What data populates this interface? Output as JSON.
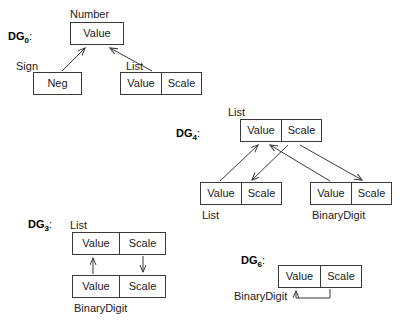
{
  "diagram": {
    "title_text": "",
    "stroke_color": "#3a3a3a",
    "text_color": "#1a1a1a",
    "background_color": "#ffffff",
    "cell_labels": {
      "value": "Value",
      "scale": "Scale",
      "neg": "Neg"
    },
    "type_labels": {
      "number": "Number",
      "sign": "Sign",
      "list": "List",
      "binary_digit": "BinaryDigit"
    },
    "graphs": [
      {
        "id": "dg0",
        "name": "DG",
        "subscript": "0",
        "colon": ":",
        "nodes": [
          {
            "id": "dg0-root",
            "type_label": "Number",
            "cells": [
              "Value"
            ]
          },
          {
            "id": "dg0-sign",
            "type_label": "Sign",
            "cells": [
              "Neg"
            ]
          },
          {
            "id": "dg0-list",
            "type_label": "List",
            "cells": [
              "Value",
              "Scale"
            ]
          }
        ],
        "edges": [
          {
            "from": "dg0-sign",
            "to": "dg0-root",
            "direction": "up"
          },
          {
            "from": "dg0-list",
            "to": "dg0-root",
            "direction": "up"
          }
        ]
      },
      {
        "id": "dg4",
        "name": "DG",
        "subscript": "4",
        "colon": ":",
        "nodes": [
          {
            "id": "dg4-top",
            "type_label": "List",
            "cells": [
              "Value",
              "Scale"
            ]
          },
          {
            "id": "dg4-left",
            "type_label": "List",
            "cells": [
              "Value",
              "Scale"
            ]
          },
          {
            "id": "dg4-right",
            "type_label": "BinaryDigit",
            "cells": [
              "Value",
              "Scale"
            ]
          }
        ],
        "edges": [
          {
            "from": "dg4-left.Value",
            "to": "dg4-top.Value",
            "direction": "up"
          },
          {
            "from": "dg4-right.Value",
            "to": "dg4-top.Value",
            "direction": "up"
          },
          {
            "from": "dg4-top.Scale",
            "to": "dg4-left.Scale",
            "direction": "down"
          },
          {
            "from": "dg4-top.Scale",
            "to": "dg4-right.Scale",
            "direction": "down"
          }
        ]
      },
      {
        "id": "dg3",
        "name": "DG",
        "subscript": "3",
        "colon": ":",
        "nodes": [
          {
            "id": "dg3-top",
            "type_label": "List",
            "cells": [
              "Value",
              "Scale"
            ]
          },
          {
            "id": "dg3-bottom",
            "type_label": "BinaryDigit",
            "cells": [
              "Value",
              "Scale"
            ]
          }
        ],
        "edges": [
          {
            "from": "dg3-bottom.Value",
            "to": "dg3-top.Value",
            "direction": "up"
          },
          {
            "from": "dg3-top.Scale",
            "to": "dg3-bottom.Scale",
            "direction": "down"
          }
        ]
      },
      {
        "id": "dg6",
        "name": "DG",
        "subscript": "6",
        "colon": ":",
        "nodes": [
          {
            "id": "dg6-node",
            "type_label": "BinaryDigit",
            "cells": [
              "Value",
              "Scale"
            ]
          }
        ],
        "edges": [
          {
            "from": "dg6-node.Scale",
            "to": "dg6-node.Value",
            "direction": "self-loop"
          }
        ]
      }
    ]
  }
}
